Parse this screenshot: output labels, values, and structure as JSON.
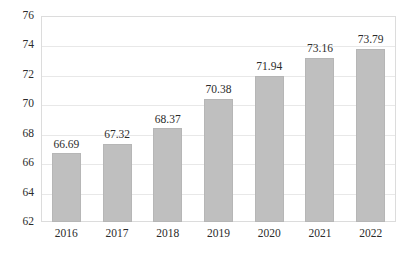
{
  "chart_data": {
    "type": "bar",
    "title": "",
    "subtitle": "",
    "xlabel": "",
    "ylabel": "",
    "categories": [
      "2016",
      "2017",
      "2018",
      "2019",
      "2020",
      "2021",
      "2022"
    ],
    "values": [
      66.69,
      67.32,
      68.37,
      70.38,
      71.94,
      73.16,
      73.79
    ],
    "value_labels": [
      "66.69",
      "67.32",
      "68.37",
      "70.38",
      "71.94",
      "73.16",
      "73.79"
    ],
    "ylim": [
      62,
      76
    ],
    "yticks": [
      62,
      64,
      66,
      68,
      70,
      72,
      74,
      76
    ],
    "ytick_labels": [
      "62",
      "64",
      "66",
      "68",
      "70",
      "72",
      "74",
      "76"
    ],
    "grid": true,
    "grid_axis": "y",
    "legend": null,
    "legend_position": "none",
    "series": [
      {
        "name": "",
        "values": [
          66.69,
          67.32,
          68.37,
          70.38,
          71.94,
          73.16,
          73.79
        ]
      }
    ],
    "colors": {
      "bar_fill": "#bfbfbf",
      "bar_border": "#b6b6b6",
      "gridline": "#e8e8e8",
      "plot_border": "#dcdcdc",
      "text": "#2b2b2b",
      "background": "#ffffff"
    }
  }
}
